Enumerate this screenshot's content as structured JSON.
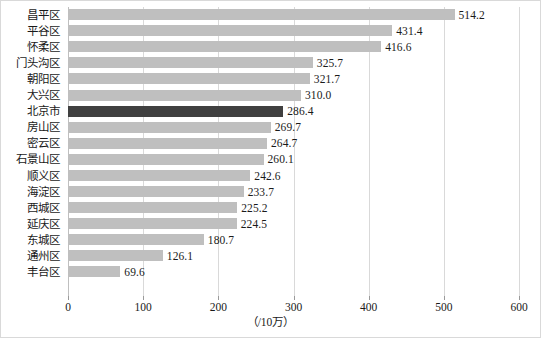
{
  "chart_data": {
    "type": "bar",
    "orientation": "horizontal",
    "title": "",
    "xlabel": "（/10万）",
    "ylabel": "",
    "xlim": [
      0,
      600
    ],
    "xticks": [
      0,
      100,
      200,
      300,
      400,
      500,
      600
    ],
    "xtick_labels": [
      "0",
      "100",
      "200",
      "300",
      "400",
      "500",
      "600"
    ],
    "grid": true,
    "grid_axis": "x",
    "legend": false,
    "categories": [
      "昌平区",
      "平谷区",
      "怀柔区",
      "门头沟区",
      "朝阳区",
      "大兴区",
      "北京市",
      "房山区",
      "密云区",
      "石景山区",
      "顺义区",
      "海淀区",
      "西城区",
      "延庆区",
      "东城区",
      "通州区",
      "丰台区"
    ],
    "values": [
      514.2,
      431.4,
      416.6,
      325.7,
      321.7,
      310.0,
      286.4,
      269.7,
      264.7,
      260.1,
      242.6,
      233.7,
      225.2,
      224.5,
      180.7,
      126.1,
      69.6
    ],
    "value_labels": [
      "514.2",
      "431.4",
      "416.6",
      "325.7",
      "321.7",
      "310.0",
      "286.4",
      "269.7",
      "264.7",
      "260.1",
      "242.6",
      "233.7",
      "225.2",
      "224.5",
      "180.7",
      "126.1",
      "69.6"
    ],
    "highlight_index": 6,
    "colors": {
      "bar": "#bfbfbf",
      "bar_highlight": "#404040",
      "gridline": "#d9d9d9",
      "axis": "#bfbfbf",
      "text": "#1a1a1a",
      "frame": "#d9d9d9",
      "background": "#ffffff"
    }
  }
}
